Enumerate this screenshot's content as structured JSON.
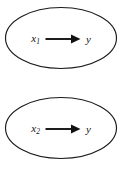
{
  "figure": {
    "type": "causal-diagram",
    "background_color": "#ffffff",
    "stroke_color": "#1a1a1a",
    "text_color": "#111111",
    "node_count": 2
  },
  "nodes": [
    {
      "id": "relation-1",
      "cause": "x",
      "cause_subscript": "1",
      "relation_symbol": "arrow-right",
      "effect": "y"
    },
    {
      "id": "relation-2",
      "cause": "x",
      "cause_subscript": "2",
      "relation_symbol": "arrow-right",
      "effect": "y"
    }
  ]
}
